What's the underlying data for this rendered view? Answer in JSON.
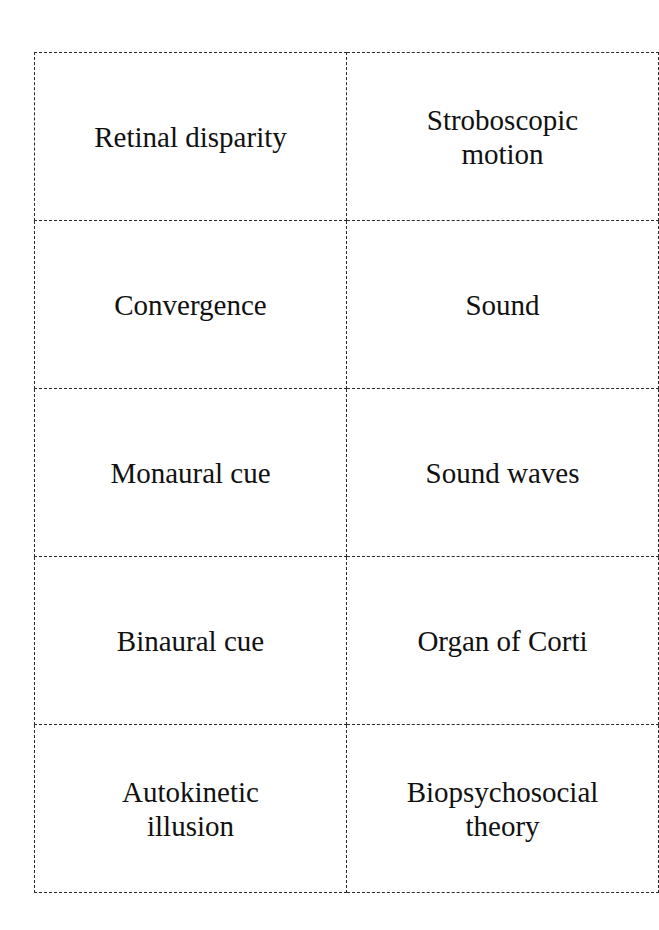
{
  "document": {
    "type": "flashcard-sheet",
    "rows": [
      [
        "Retinal disparity",
        "Stroboscopic motion"
      ],
      [
        "Convergence",
        "Sound"
      ],
      [
        "Monaural cue",
        "Sound waves"
      ],
      [
        "Binaural cue",
        "Organ of Corti"
      ],
      [
        "Autokinetic illusion",
        "Biopsychosocial theory"
      ]
    ]
  }
}
